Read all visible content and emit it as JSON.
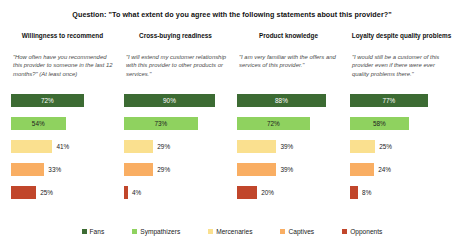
{
  "chart_data": {
    "type": "bar",
    "title": "Question: \"To what extent do you agree with the following statements about this provider?\"",
    "orientation": "horizontal",
    "xlabel": "",
    "ylabel": "",
    "xlim": [
      0,
      100
    ],
    "grid": false,
    "legend_position": "bottom",
    "categories": [
      "Fans",
      "Sympathizers",
      "Mercenaries",
      "Captives",
      "Opponents"
    ],
    "panels": [
      {
        "header": "Willingness to recommend",
        "quote": "\"How often have you recommended this provider to someone in the last 12 months?\" (At least once)",
        "values": [
          72,
          54,
          41,
          33,
          25
        ],
        "labels": [
          "72%",
          "54%",
          "41%",
          "33%",
          "25%"
        ]
      },
      {
        "header": "Cross-buying readiness",
        "quote": "\"I will extend my customer relationship with this provider to other products or services.\"",
        "values": [
          90,
          73,
          29,
          29,
          4
        ],
        "labels": [
          "90%",
          "73%",
          "29%",
          "29%",
          "4%"
        ]
      },
      {
        "header": "Product knowledge",
        "quote": "\"I am very familiar with the offers and services of this provider.\"",
        "values": [
          88,
          72,
          39,
          39,
          20
        ],
        "labels": [
          "88%",
          "72%",
          "39%",
          "39%",
          "20%"
        ]
      },
      {
        "header": "Loyalty despite quality problems",
        "quote": "\"I would still be a customer of this provider even if there were ever quality problems there.\"",
        "values": [
          77,
          58,
          25,
          24,
          8
        ],
        "labels": [
          "77%",
          "58%",
          "25%",
          "24%",
          "8%"
        ]
      }
    ],
    "series_colors": [
      "#3c6b33",
      "#8fd25f",
      "#fae08f",
      "#f9ae63",
      "#c1462b"
    ]
  },
  "legend": {
    "items": [
      {
        "label": "Fans",
        "color": "#3c6b33"
      },
      {
        "label": "Sympathizers",
        "color": "#8fd25f"
      },
      {
        "label": "Mercenaries",
        "color": "#fae08f"
      },
      {
        "label": "Captives",
        "color": "#f9ae63"
      },
      {
        "label": "Opponents",
        "color": "#c1462b"
      }
    ]
  }
}
